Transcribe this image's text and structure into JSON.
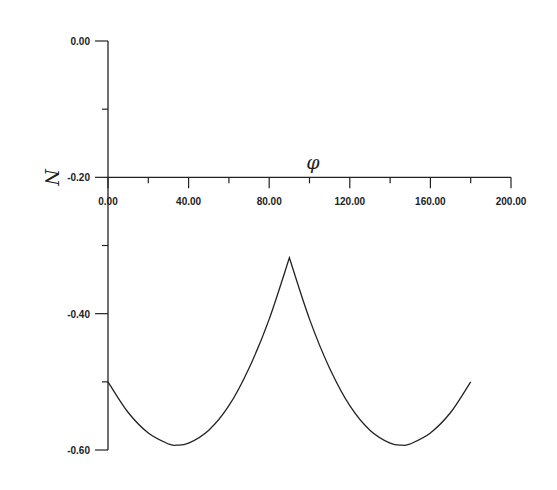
{
  "chart_data": {
    "type": "line",
    "title": "",
    "xlabel": "φ",
    "ylabel": "N",
    "xlim": [
      0,
      200
    ],
    "ylim": [
      -0.6,
      0.0
    ],
    "x_ticks": [
      "0.00",
      "40.00",
      "80.00",
      "120.00",
      "160.00",
      "200.00"
    ],
    "y_ticks": [
      "0.00",
      "-0.20",
      "-0.40",
      "-0.60"
    ],
    "grid": false,
    "legend": null,
    "x_axis_position": -0.2,
    "series": [
      {
        "name": "N(φ)",
        "x": [
          0,
          10,
          20,
          30,
          34,
          40,
          50,
          60,
          70,
          80,
          90,
          100,
          110,
          120,
          130,
          140,
          146,
          150,
          160,
          170,
          180
        ],
        "y": [
          -0.5,
          -0.545,
          -0.575,
          -0.591,
          -0.593,
          -0.59,
          -0.571,
          -0.535,
          -0.48,
          -0.408,
          -0.318,
          -0.408,
          -0.48,
          -0.535,
          -0.571,
          -0.59,
          -0.593,
          -0.591,
          -0.575,
          -0.545,
          -0.5
        ]
      }
    ]
  }
}
